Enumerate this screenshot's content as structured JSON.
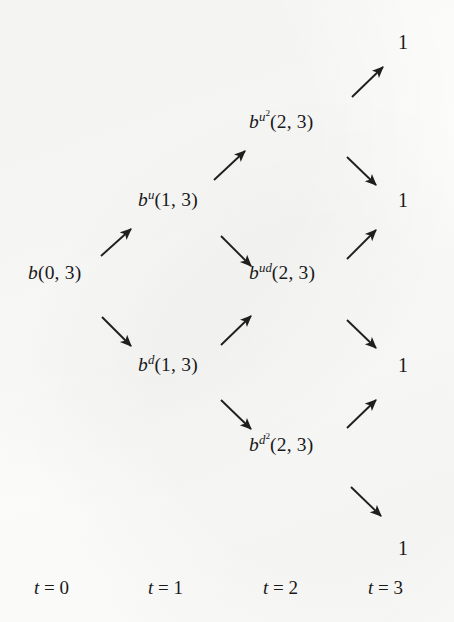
{
  "figure": {
    "type": "diagram",
    "kind": "recombining-binomial-lattice",
    "periods": [
      "t = 0",
      "t = 1",
      "t = 2",
      "t = 3"
    ]
  },
  "nodes": [
    {
      "id": "b",
      "base": "b",
      "sup": "",
      "sup_exp": "",
      "args": "(0, 3)",
      "x": 28,
      "y": 263
    },
    {
      "id": "bu",
      "base": "b",
      "sup": "u",
      "sup_exp": "",
      "args": "(1, 3)",
      "x": 138,
      "y": 190
    },
    {
      "id": "bd",
      "base": "b",
      "sup": "d",
      "sup_exp": "",
      "args": "(1, 3)",
      "x": 138,
      "y": 355
    },
    {
      "id": "bu2",
      "base": "b",
      "sup": "u",
      "sup_exp": "2",
      "args": "(2, 3)",
      "x": 249,
      "y": 112
    },
    {
      "id": "bud",
      "base": "b",
      "sup": "ud",
      "sup_exp": "",
      "args": "(2, 3)",
      "x": 249,
      "y": 263
    },
    {
      "id": "bd2",
      "base": "b",
      "sup": "d",
      "sup_exp": "2",
      "args": "(2, 3)",
      "x": 249,
      "y": 435
    }
  ],
  "terminals": [
    {
      "id": "t-uuu",
      "value": "1",
      "x": 398,
      "y": 32
    },
    {
      "id": "t-uud",
      "value": "1",
      "x": 398,
      "y": 190
    },
    {
      "id": "t-udd",
      "value": "1",
      "x": 398,
      "y": 355
    },
    {
      "id": "t-ddd",
      "value": "1",
      "x": 398,
      "y": 538
    }
  ],
  "edges": [
    {
      "id": "edge-b-bu",
      "from": "b",
      "to": "bu",
      "direction": "up",
      "x1": 101,
      "y1": 256,
      "x2": 131,
      "y2": 229
    },
    {
      "id": "edge-b-bd",
      "from": "b",
      "to": "bd",
      "direction": "down",
      "x1": 102,
      "y1": 317,
      "x2": 131,
      "y2": 346
    },
    {
      "id": "edge-bu-bu2",
      "from": "bu",
      "to": "bu2",
      "direction": "up",
      "x1": 214,
      "y1": 180,
      "x2": 245,
      "y2": 151
    },
    {
      "id": "edge-bu-bud",
      "from": "bu",
      "to": "bud",
      "direction": "down",
      "x1": 221,
      "y1": 236,
      "x2": 251,
      "y2": 266
    },
    {
      "id": "edge-bd-bud",
      "from": "bd",
      "to": "bud",
      "direction": "up",
      "x1": 221,
      "y1": 345,
      "x2": 251,
      "y2": 316
    },
    {
      "id": "edge-bd-bd2",
      "from": "bd",
      "to": "bd2",
      "direction": "down",
      "x1": 221,
      "y1": 400,
      "x2": 251,
      "y2": 429
    },
    {
      "id": "edge-bu2-t1",
      "from": "bu2",
      "to": "t-uuu",
      "direction": "up",
      "x1": 352,
      "y1": 97,
      "x2": 383,
      "y2": 67
    },
    {
      "id": "edge-bu2-t2",
      "from": "bu2",
      "to": "t-uud",
      "direction": "down",
      "x1": 347,
      "y1": 157,
      "x2": 376,
      "y2": 185
    },
    {
      "id": "edge-bud-t2",
      "from": "bud",
      "to": "t-uud",
      "direction": "up",
      "x1": 347,
      "y1": 259,
      "x2": 376,
      "y2": 230
    },
    {
      "id": "edge-bud-t3",
      "from": "bud",
      "to": "t-udd",
      "direction": "down",
      "x1": 347,
      "y1": 320,
      "x2": 376,
      "y2": 348
    },
    {
      "id": "edge-bd2-t3",
      "from": "bd2",
      "to": "t-udd",
      "direction": "up",
      "x1": 347,
      "y1": 428,
      "x2": 376,
      "y2": 400
    },
    {
      "id": "edge-bd2-t4",
      "from": "bd2",
      "to": "t-ddd",
      "direction": "down",
      "x1": 351,
      "y1": 487,
      "x2": 381,
      "y2": 516
    }
  ],
  "axis": [
    {
      "id": "axis-t0",
      "var": "t",
      "eq": " = ",
      "num": "0",
      "x": 34,
      "y": 578
    },
    {
      "id": "axis-t1",
      "var": "t",
      "eq": " = ",
      "num": "1",
      "x": 148,
      "y": 578
    },
    {
      "id": "axis-t2",
      "var": "t",
      "eq": " = ",
      "num": "2",
      "x": 263,
      "y": 578
    },
    {
      "id": "axis-t3",
      "var": "t",
      "eq": " = ",
      "num": "3",
      "x": 368,
      "y": 578
    }
  ],
  "colors": {
    "ink": "#191919",
    "paper": "#fcfcfb"
  }
}
